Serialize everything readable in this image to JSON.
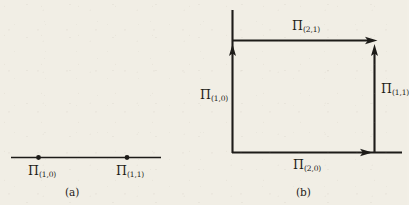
{
  "figure": {
    "background_color": "#f1eee5",
    "ink_color": "#1d1b18",
    "panels": [
      {
        "id": "panel-a",
        "caption": "(a)",
        "description": "one-dimensional cell complex: a single horizontal edge with two vertices",
        "labels": [
          {
            "id": "label-pi-1-0",
            "pi": "Π",
            "subscript": "(1,0)",
            "role": "left vertex"
          },
          {
            "id": "label-pi-1-1",
            "pi": "Π",
            "subscript": "(1,1)",
            "role": "right vertex"
          }
        ]
      },
      {
        "id": "panel-b",
        "caption": "(b)",
        "description": "two-dimensional cell complex: a square with directed edges",
        "labels": [
          {
            "id": "label-pi-2-1",
            "pi": "Π",
            "subscript": "(2,1)",
            "role": "top horizontal arrow"
          },
          {
            "id": "label-pi-1-0b",
            "pi": "Π",
            "subscript": "(1,0)",
            "role": "left vertical arrow"
          },
          {
            "id": "label-pi-1-1b",
            "pi": "Π",
            "subscript": "(1,1)",
            "role": "right vertical arrow"
          },
          {
            "id": "label-pi-2-0",
            "pi": "Π",
            "subscript": "(2,0)",
            "role": "bottom horizontal arrow"
          }
        ]
      }
    ]
  },
  "panel_a": {
    "caption": "(a)",
    "label_left": {
      "pi": "Π",
      "sub": "(1,0)"
    },
    "label_right": {
      "pi": "Π",
      "sub": "(1,1)"
    }
  },
  "panel_b": {
    "caption": "(b)",
    "label_top": {
      "pi": "Π",
      "sub": "(2,1)"
    },
    "label_left": {
      "pi": "Π",
      "sub": "(1,0)"
    },
    "label_right": {
      "pi": "Π",
      "sub": "(1,1)"
    },
    "label_bottom": {
      "pi": "Π",
      "sub": "(2,0)"
    }
  }
}
